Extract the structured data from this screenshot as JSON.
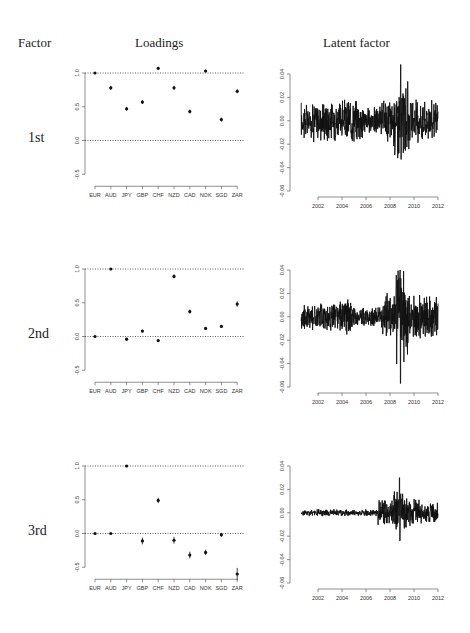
{
  "headers": {
    "factor": "Factor",
    "loadings": "Loadings",
    "latent": "Latent factor"
  },
  "rows": [
    {
      "label": "1st"
    },
    {
      "label": "2nd"
    },
    {
      "label": "3rd"
    }
  ],
  "chart_data": [
    {
      "type": "scatter",
      "title": "Loadings - 1st factor",
      "categories": [
        "EUR",
        "AUD",
        "JPY",
        "GBP",
        "CHF",
        "NZD",
        "CAD",
        "NOK",
        "SGD",
        "ZAR"
      ],
      "values": [
        1.0,
        0.78,
        0.47,
        0.57,
        1.07,
        0.78,
        0.43,
        1.03,
        0.31,
        0.73
      ],
      "error_half_width": [
        0.01,
        0.03,
        0.03,
        0.03,
        0.02,
        0.03,
        0.03,
        0.02,
        0.03,
        0.03
      ],
      "ylim": [
        -0.5,
        1.0
      ],
      "yticks": [
        "-0.5",
        "0.0",
        "0.5",
        "1.0"
      ],
      "reference_lines": [
        0.0,
        1.0
      ],
      "xlabel": "",
      "ylabel": ""
    },
    {
      "type": "line",
      "title": "Latent factor - 1st",
      "x_range": [
        2000.6,
        2012
      ],
      "xticks": [
        "2002",
        "2004",
        "2006",
        "2008",
        "2010",
        "2012"
      ],
      "yticks": [
        "-0.06",
        "-0.04",
        "-0.02",
        "0.00",
        "0.02",
        "0.04"
      ],
      "ylim": [
        -0.06,
        0.04
      ],
      "envelope": {
        "typical_amplitude": 0.012,
        "max": 0.048,
        "min": -0.033,
        "spike_year": 2008.9
      }
    },
    {
      "type": "scatter",
      "title": "Loadings - 2nd factor",
      "categories": [
        "EUR",
        "AUD",
        "JPY",
        "GBP",
        "CHF",
        "NZD",
        "CAD",
        "NOK",
        "SGD",
        "ZAR"
      ],
      "values": [
        0.0,
        1.0,
        -0.04,
        0.08,
        -0.06,
        0.89,
        0.37,
        0.12,
        0.15,
        0.48
      ],
      "error_half_width": [
        0.01,
        0.01,
        0.02,
        0.02,
        0.02,
        0.03,
        0.03,
        0.02,
        0.02,
        0.04
      ],
      "ylim": [
        -0.5,
        1.0
      ],
      "yticks": [
        "-0.5",
        "0.0",
        "0.5",
        "1.0"
      ],
      "reference_lines": [
        0.0,
        1.0
      ]
    },
    {
      "type": "line",
      "title": "Latent factor - 2nd",
      "x_range": [
        2000.6,
        2012
      ],
      "xticks": [
        "2002",
        "2004",
        "2006",
        "2008",
        "2010",
        "2012"
      ],
      "yticks": [
        "-0.06",
        "-0.04",
        "-0.02",
        "0.00",
        "0.02",
        "0.04"
      ],
      "ylim": [
        -0.06,
        0.04
      ],
      "envelope": {
        "typical_amplitude": 0.01,
        "max": 0.04,
        "min": -0.057,
        "spike_year": 2008.85
      }
    },
    {
      "type": "scatter",
      "title": "Loadings - 3rd factor",
      "categories": [
        "EUR",
        "AUD",
        "JPY",
        "GBP",
        "CHF",
        "NZD",
        "CAD",
        "NOK",
        "SGD",
        "ZAR"
      ],
      "values": [
        0.0,
        0.0,
        1.0,
        -0.11,
        0.49,
        -0.1,
        -0.32,
        -0.28,
        -0.02,
        -0.6
      ],
      "error_half_width": [
        0.01,
        0.01,
        0.01,
        0.05,
        0.04,
        0.05,
        0.05,
        0.04,
        0.03,
        0.09
      ],
      "ylim": [
        -0.5,
        1.0
      ],
      "yticks": [
        "-0.5",
        "0.0",
        "0.5",
        "1.0"
      ],
      "reference_lines": [
        0.0,
        1.0
      ]
    },
    {
      "type": "line",
      "title": "Latent factor - 3rd",
      "x_range": [
        2000.6,
        2012
      ],
      "xticks": [
        "2002",
        "2004",
        "2006",
        "2008",
        "2010",
        "2012"
      ],
      "yticks": [
        "-0.06",
        "-0.04",
        "-0.02",
        "0.00",
        "0.02",
        "0.04"
      ],
      "ylim": [
        -0.06,
        0.04
      ],
      "envelope": {
        "typical_amplitude": 0.002,
        "max": 0.03,
        "min": -0.024,
        "active_from_year": 2007
      }
    }
  ]
}
